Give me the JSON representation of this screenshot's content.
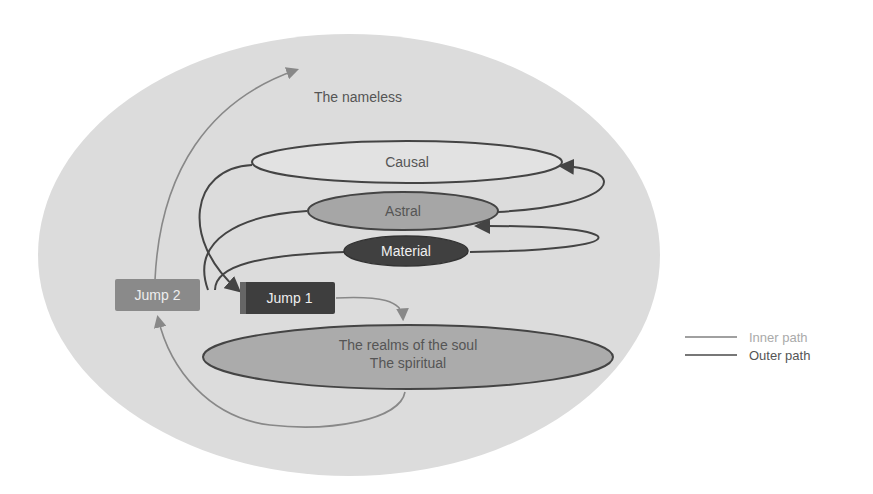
{
  "diagram": {
    "top_label": "The nameless",
    "planes": {
      "causal": "Causal",
      "astral": "Astral",
      "material": "Material"
    },
    "jumps": {
      "jump1": "Jump 1",
      "jump2": "Jump 2"
    },
    "soul": {
      "line1": "The realms of the soul",
      "line2": "The spiritual"
    }
  },
  "legend": {
    "inner": "Inner path",
    "outer": "Outer path"
  },
  "colors": {
    "background_ellipse": "#dcdcdc",
    "causal_fill": "#e2e2e2",
    "astral_fill": "#a6a6a6",
    "material_fill": "#404040",
    "jump1_fill": "#3e3e3e",
    "jump2_fill": "#8a8a8a",
    "soul_fill": "#ababab",
    "inner_path": "#a0a0a0",
    "outer_path": "#444444"
  }
}
